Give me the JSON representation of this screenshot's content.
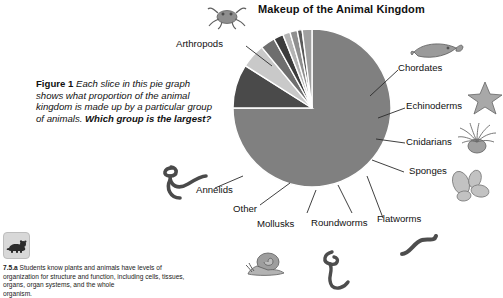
{
  "chart_title": "Makeup of the Animal Kingdom",
  "caption": {
    "fig_number": "Figure 1",
    "body": "Each slice in this pie graph shows what proportion of the animal kingdom is made up by a particular group of animals. ",
    "question": "Which group is the largest?"
  },
  "standard": {
    "code": "7.5.a",
    "text": "Students know plants and animals have levels of organization for structure and function, including cells, tissues, organs, organ systems, and the whole",
    "clipped_line": "organism.",
    "icon": "bear-icon"
  },
  "labels": {
    "arthropods": "Arthropods",
    "chordates": "Chordates",
    "echinoderms": "Echinoderms",
    "cnidarians": "Cnidarians",
    "sponges": "Sponges",
    "flatworms": "Flatworms",
    "roundworms": "Roundworms",
    "mollusks": "Mollusks",
    "other": "Other",
    "annelids": "Annelids"
  },
  "icons": {
    "crab": "crab-icon",
    "fish": "fish-icon",
    "starfish": "starfish-icon",
    "sea_anemone": "sea-anemone-icon",
    "sponge": "sponge-icon",
    "flatworm": "flatworm-icon",
    "roundworm": "roundworm-icon",
    "snail": "snail-icon",
    "earthworm": "earthworm-icon"
  },
  "colors": {
    "arthropods": "#808080",
    "other": "#4a4a4a",
    "mollusks": "#c9c9c9",
    "roundworms": "#6e6e6e",
    "flatworms": "#3c3c3c",
    "sponges": "#b4b4b4",
    "cnidarians": "#8f8f8f",
    "echinoderms": "#5a5a5a",
    "chordates": "#a0a0a0",
    "separator": "#ffffff",
    "leader": "#2a2a2a",
    "text": "#111111"
  },
  "chart_data": {
    "type": "pie",
    "title": "Makeup of the Animal Kingdom",
    "xlabel": "",
    "ylabel": "",
    "legend_position": "callout-labels",
    "grid": false,
    "start_angle_deg": -90,
    "direction": "clockwise",
    "categories": [
      "Arthropods",
      "Other",
      "Mollusks",
      "Roundworms",
      "Flatworms",
      "Sponges",
      "Cnidarians",
      "Echinoderms",
      "Chordates"
    ],
    "values": [
      75,
      9,
      5,
      3,
      2,
      1.5,
      1.5,
      1,
      2
    ],
    "unit": "percent of known animal species",
    "annotations": [
      "Arthropods form by far the largest slice of the pie.",
      "The remaining groups are thin slices fanned out to the lower right."
    ]
  }
}
